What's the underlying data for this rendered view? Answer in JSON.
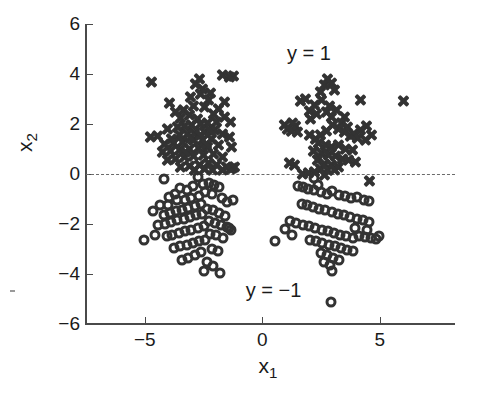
{
  "chart_data": {
    "type": "scatter",
    "title": "",
    "xlabel": "x_1",
    "ylabel": "x_2",
    "xlim": [
      -7.5,
      8.2
    ],
    "ylim": [
      -6,
      6
    ],
    "xticks": [
      -5,
      0,
      5
    ],
    "xticklabels": [
      "-5",
      "0",
      "5"
    ],
    "yticks": [
      -6,
      -4,
      -2,
      0,
      2,
      4,
      6
    ],
    "yticklabels": [
      "-6",
      "-4",
      "-2",
      "0",
      "2",
      "4",
      "6"
    ],
    "grid": false,
    "legend_position": "none",
    "annotations": [
      {
        "text": "y = 1",
        "x": 1.05,
        "y": 4.85
      },
      {
        "text": "y = −1",
        "x": -0.7,
        "y": -4.62
      }
    ],
    "reference_lines": [
      {
        "orientation": "horizontal",
        "value": 0,
        "style": "dashed",
        "color": "#6b6b6b"
      }
    ],
    "marker_color": "#333333",
    "series": [
      {
        "name": "y = 1",
        "marker": "x",
        "points": [
          [
            -4.72,
            3.7
          ],
          [
            -2.7,
            3.82
          ],
          [
            -1.7,
            3.95
          ],
          [
            -1.22,
            3.93
          ],
          [
            -1.4,
            3.9
          ],
          [
            -2.55,
            3.4
          ],
          [
            -2.2,
            3.25
          ],
          [
            -2.62,
            3.22
          ],
          [
            -3.05,
            3.08
          ],
          [
            -3.95,
            2.85
          ],
          [
            -2.3,
            2.95
          ],
          [
            -2.95,
            2.72
          ],
          [
            -2.45,
            2.68
          ],
          [
            -3.35,
            2.55
          ],
          [
            -3.7,
            2.48
          ],
          [
            -1.85,
            2.6
          ],
          [
            -2.1,
            2.4
          ],
          [
            -3.1,
            2.35
          ],
          [
            -3.5,
            2.25
          ],
          [
            -2.75,
            2.22
          ],
          [
            -1.6,
            2.28
          ],
          [
            -1.35,
            2.08
          ],
          [
            -1.95,
            2.1
          ],
          [
            -2.35,
            2.05
          ],
          [
            -2.62,
            2.0
          ],
          [
            -3.0,
            1.98
          ],
          [
            -3.3,
            1.92
          ],
          [
            -3.62,
            1.88
          ],
          [
            -4.05,
            1.82
          ],
          [
            -4.45,
            1.52
          ],
          [
            -4.75,
            1.5
          ],
          [
            -2.05,
            1.78
          ],
          [
            -2.48,
            1.7
          ],
          [
            -2.88,
            1.65
          ],
          [
            -3.2,
            1.62
          ],
          [
            -3.55,
            1.58
          ],
          [
            -1.7,
            1.62
          ],
          [
            -1.42,
            1.48
          ],
          [
            -2.15,
            1.42
          ],
          [
            -2.55,
            1.38
          ],
          [
            -2.95,
            1.35
          ],
          [
            -3.4,
            1.3
          ],
          [
            -3.8,
            1.25
          ],
          [
            -4.15,
            1.2
          ],
          [
            -1.3,
            1.08
          ],
          [
            -1.88,
            1.15
          ],
          [
            -2.32,
            1.1
          ],
          [
            -2.72,
            1.05
          ],
          [
            -3.12,
            1.02
          ],
          [
            -3.52,
            0.98
          ],
          [
            -3.92,
            0.92
          ],
          [
            -4.25,
            0.88
          ],
          [
            -2.1,
            0.82
          ],
          [
            -2.52,
            0.78
          ],
          [
            -2.92,
            0.72
          ],
          [
            -3.32,
            0.68
          ],
          [
            -3.7,
            0.62
          ],
          [
            -4.05,
            0.58
          ],
          [
            -1.72,
            0.7
          ],
          [
            -2.3,
            0.45
          ],
          [
            -2.7,
            0.38
          ],
          [
            -3.1,
            0.32
          ],
          [
            -3.48,
            0.28
          ],
          [
            -1.95,
            0.35
          ],
          [
            -1.55,
            0.28
          ],
          [
            -1.28,
            0.25
          ],
          [
            -2.88,
            0.18
          ],
          [
            -2.48,
            0.2
          ],
          [
            -2.12,
            0.15
          ],
          [
            -1.68,
            0.18
          ],
          [
            -1.35,
            0.22
          ],
          [
            -1.18,
            0.28
          ],
          [
            -3.28,
            0.88
          ],
          [
            -3.05,
            1.45
          ],
          [
            -2.62,
            1.55
          ],
          [
            -2.2,
            1.72
          ],
          [
            -3.85,
            1.42
          ],
          [
            -1.62,
            2.88
          ],
          [
            -2.85,
            3.62
          ],
          [
            -2.38,
            1.22
          ],
          [
            0.95,
            1.95
          ],
          [
            1.05,
            1.82
          ],
          [
            1.28,
            2.05
          ],
          [
            1.42,
            1.92
          ],
          [
            1.15,
            0.45
          ],
          [
            1.35,
            0.38
          ],
          [
            1.72,
            0.02
          ],
          [
            1.95,
            0.05
          ],
          [
            1.6,
            2.92
          ],
          [
            1.85,
            3.02
          ],
          [
            2.02,
            2.52
          ],
          [
            2.22,
            2.75
          ],
          [
            2.45,
            3.28
          ],
          [
            2.62,
            3.55
          ],
          [
            2.78,
            3.82
          ],
          [
            2.95,
            3.65
          ],
          [
            3.05,
            3.38
          ],
          [
            2.5,
            2.95
          ],
          [
            2.28,
            2.42
          ],
          [
            2.05,
            2.2
          ],
          [
            2.72,
            2.48
          ],
          [
            2.95,
            2.3
          ],
          [
            3.15,
            2.55
          ],
          [
            3.38,
            2.05
          ],
          [
            3.62,
            1.88
          ],
          [
            3.88,
            1.62
          ],
          [
            4.15,
            1.78
          ],
          [
            4.42,
            1.92
          ],
          [
            4.62,
            1.58
          ],
          [
            4.38,
            1.38
          ],
          [
            4.05,
            1.45
          ],
          [
            3.75,
            1.52
          ],
          [
            3.48,
            1.68
          ],
          [
            3.22,
            1.82
          ],
          [
            2.98,
            1.95
          ],
          [
            2.72,
            1.72
          ],
          [
            2.48,
            1.55
          ],
          [
            2.25,
            1.42
          ],
          [
            2.02,
            1.58
          ],
          [
            2.38,
            1.25
          ],
          [
            2.68,
            1.18
          ],
          [
            2.95,
            1.08
          ],
          [
            3.25,
            1.15
          ],
          [
            3.55,
            1.02
          ],
          [
            3.85,
            0.95
          ],
          [
            2.18,
            0.92
          ],
          [
            2.52,
            0.85
          ],
          [
            2.82,
            0.78
          ],
          [
            3.12,
            0.72
          ],
          [
            3.42,
            0.62
          ],
          [
            3.68,
            0.55
          ],
          [
            3.95,
            0.48
          ],
          [
            2.32,
            0.55
          ],
          [
            2.62,
            0.42
          ],
          [
            2.92,
            0.35
          ],
          [
            3.22,
            0.28
          ],
          [
            2.48,
            0.22
          ],
          [
            2.78,
            0.15
          ],
          [
            3.05,
            0.18
          ],
          [
            2.2,
            0.08
          ],
          [
            2.62,
            -0.05
          ],
          [
            4.55,
            -0.28
          ],
          [
            6.02,
            2.92
          ],
          [
            4.15,
            2.95
          ],
          [
            3.48,
            2.28
          ],
          [
            2.85,
            2.72
          ],
          [
            1.48,
            1.68
          ],
          [
            1.22,
            1.72
          ]
        ]
      },
      {
        "name": "y = -1",
        "marker": "o",
        "points": [
          [
            -5.05,
            -2.62
          ],
          [
            -4.55,
            -2.42
          ],
          [
            -4.18,
            -0.18
          ],
          [
            -2.75,
            -0.12
          ],
          [
            -2.52,
            -0.38
          ],
          [
            -2.28,
            -0.35
          ],
          [
            -2.05,
            -0.42
          ],
          [
            -1.85,
            -0.52
          ],
          [
            -2.95,
            -0.48
          ],
          [
            -3.22,
            -0.62
          ],
          [
            -3.48,
            -0.55
          ],
          [
            -3.72,
            -0.78
          ],
          [
            -4.02,
            -1.25
          ],
          [
            -4.35,
            -1.22
          ],
          [
            -3.95,
            -0.92
          ],
          [
            -3.62,
            -1.02
          ],
          [
            -3.3,
            -1.05
          ],
          [
            -3.02,
            -0.95
          ],
          [
            -2.7,
            -0.88
          ],
          [
            -2.42,
            -0.72
          ],
          [
            -2.15,
            -0.78
          ],
          [
            -1.72,
            -0.95
          ],
          [
            -1.48,
            -1.12
          ],
          [
            -1.25,
            -1.05
          ],
          [
            -2.62,
            -1.18
          ],
          [
            -2.88,
            -1.28
          ],
          [
            -3.15,
            -1.35
          ],
          [
            -3.42,
            -1.42
          ],
          [
            -3.68,
            -1.48
          ],
          [
            -3.92,
            -1.55
          ],
          [
            -4.18,
            -1.62
          ],
          [
            -2.35,
            -1.38
          ],
          [
            -2.08,
            -1.45
          ],
          [
            -1.82,
            -1.55
          ],
          [
            -1.58,
            -1.68
          ],
          [
            -2.55,
            -1.58
          ],
          [
            -2.82,
            -1.65
          ],
          [
            -3.08,
            -1.72
          ],
          [
            -3.35,
            -1.78
          ],
          [
            -3.62,
            -1.85
          ],
          [
            -3.88,
            -1.92
          ],
          [
            -4.12,
            -1.98
          ],
          [
            -2.28,
            -1.88
          ],
          [
            -2.02,
            -1.95
          ],
          [
            -1.75,
            -2.02
          ],
          [
            -1.52,
            -2.12
          ],
          [
            -2.48,
            -2.08
          ],
          [
            -2.75,
            -2.15
          ],
          [
            -3.02,
            -2.22
          ],
          [
            -3.28,
            -2.28
          ],
          [
            -3.55,
            -2.35
          ],
          [
            -3.82,
            -2.42
          ],
          [
            -4.05,
            -2.48
          ],
          [
            -2.22,
            -2.38
          ],
          [
            -1.95,
            -2.45
          ],
          [
            -1.68,
            -2.55
          ],
          [
            -2.42,
            -2.62
          ],
          [
            -2.68,
            -2.68
          ],
          [
            -2.95,
            -2.75
          ],
          [
            -3.22,
            -2.82
          ],
          [
            -3.48,
            -2.88
          ],
          [
            -3.75,
            -2.95
          ],
          [
            -2.15,
            -2.98
          ],
          [
            -1.88,
            -3.08
          ],
          [
            -2.62,
            -3.12
          ],
          [
            -2.88,
            -3.25
          ],
          [
            -3.15,
            -3.35
          ],
          [
            -3.42,
            -3.42
          ],
          [
            -2.35,
            -3.52
          ],
          [
            -2.08,
            -3.68
          ],
          [
            -1.78,
            -3.95
          ],
          [
            -2.48,
            -3.88
          ],
          [
            -1.42,
            -2.15
          ],
          [
            -1.32,
            -2.22
          ],
          [
            -4.42,
            -2.05
          ],
          [
            -4.65,
            -1.48
          ],
          [
            0.55,
            -2.68
          ],
          [
            1.52,
            -0.48
          ],
          [
            1.75,
            -0.52
          ],
          [
            1.95,
            -0.58
          ],
          [
            2.22,
            -0.62
          ],
          [
            2.48,
            -0.72
          ],
          [
            2.75,
            -0.78
          ],
          [
            2.98,
            -0.68
          ],
          [
            3.25,
            -0.82
          ],
          [
            3.52,
            -0.88
          ],
          [
            3.78,
            -0.95
          ],
          [
            4.05,
            -0.92
          ],
          [
            4.32,
            -1.02
          ],
          [
            4.55,
            -1.08
          ],
          [
            1.68,
            -1.18
          ],
          [
            1.92,
            -1.25
          ],
          [
            2.15,
            -1.32
          ],
          [
            2.42,
            -1.38
          ],
          [
            2.68,
            -1.45
          ],
          [
            2.95,
            -1.52
          ],
          [
            3.22,
            -1.58
          ],
          [
            3.48,
            -1.65
          ],
          [
            3.72,
            -1.72
          ],
          [
            4.02,
            -1.78
          ],
          [
            4.28,
            -1.85
          ],
          [
            4.52,
            -1.92
          ],
          [
            1.45,
            -1.95
          ],
          [
            1.72,
            -2.02
          ],
          [
            1.98,
            -2.08
          ],
          [
            2.25,
            -2.15
          ],
          [
            2.52,
            -2.22
          ],
          [
            2.78,
            -2.28
          ],
          [
            3.05,
            -2.35
          ],
          [
            3.32,
            -2.42
          ],
          [
            3.58,
            -2.48
          ],
          [
            3.85,
            -2.55
          ],
          [
            4.12,
            -2.48
          ],
          [
            4.38,
            -2.52
          ],
          [
            4.62,
            -2.55
          ],
          [
            4.85,
            -2.58
          ],
          [
            4.95,
            -2.48
          ],
          [
            2.02,
            -2.62
          ],
          [
            2.28,
            -2.68
          ],
          [
            2.55,
            -2.75
          ],
          [
            2.82,
            -2.82
          ],
          [
            3.08,
            -2.88
          ],
          [
            3.35,
            -2.95
          ],
          [
            3.62,
            -3.02
          ],
          [
            3.88,
            -3.08
          ],
          [
            2.48,
            -3.15
          ],
          [
            2.75,
            -3.25
          ],
          [
            3.02,
            -3.35
          ],
          [
            3.28,
            -3.42
          ],
          [
            2.62,
            -3.52
          ],
          [
            2.88,
            -3.62
          ],
          [
            2.95,
            -3.88
          ],
          [
            2.92,
            -5.12
          ],
          [
            1.28,
            -2.42
          ],
          [
            1.18,
            -1.88
          ],
          [
            0.95,
            -2.18
          ],
          [
            2.35,
            -0.45
          ],
          [
            2.18,
            -0.15
          ],
          [
            3.95,
            -2.15
          ],
          [
            4.45,
            -2.22
          ]
        ]
      }
    ]
  }
}
